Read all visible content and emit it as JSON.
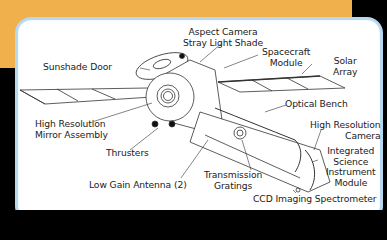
{
  "colors": {
    "background_band": "#f0b14c",
    "card_border": "#b8d8f0",
    "card_fill": "#ffffff",
    "outer": "#000000"
  },
  "labels": {
    "aspect_camera_line1": "Aspect Camera",
    "aspect_camera_line2": "Stray Light Shade",
    "sunshade_door": "Sunshade Door",
    "spacecraft_module_line1": "Spacecraft",
    "spacecraft_module_line2": "Module",
    "solar_array_line1": "Solar",
    "solar_array_line2": "Array",
    "optical_bench": "Optical Bench",
    "hrma_line1": "High Resolution",
    "hrma_line2": "Mirror Assembly",
    "hrc_line1": "High Resolution",
    "hrc_line2": "Camera",
    "thrusters": "Thrusters",
    "isim_line1": "Integrated",
    "isim_line2": "Science",
    "isim_line3": "Instrument",
    "isim_line4": "Module",
    "transmission_line1": "Transmission",
    "transmission_line2": "Gratings",
    "low_gain_antenna": "Low Gain Antenna (2)",
    "ccd_spectrometer": "CCD Imaging Spectrometer"
  }
}
